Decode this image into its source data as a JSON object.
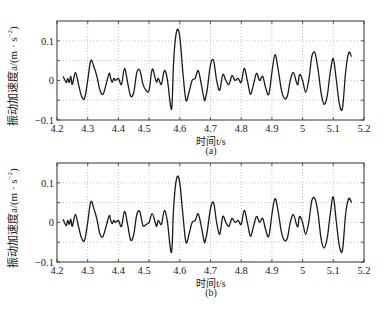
{
  "chart_data": [
    {
      "type": "line",
      "panel": "a",
      "caption": "(a)",
      "xlabel": "时间t/s",
      "ylabel": "振动加速度a/(m · s⁻²)",
      "xlim": [
        4.2,
        5.2
      ],
      "ylim": [
        -0.1,
        0.15
      ],
      "xticks": [
        "4.2",
        "4.3",
        "4.4",
        "4.5",
        "4.6",
        "4.7",
        "4.8",
        "4.9",
        "5",
        "5.1",
        "5.2"
      ],
      "yticks": [
        "-0.1",
        "0",
        "0.1"
      ],
      "grid": true,
      "series": [
        {
          "name": "acceleration",
          "x": [
            4.22,
            4.23,
            4.235,
            4.24,
            4.245,
            4.25,
            4.26,
            4.27,
            4.28,
            4.29,
            4.3,
            4.31,
            4.32,
            4.33,
            4.34,
            4.35,
            4.36,
            4.37,
            4.375,
            4.38,
            4.385,
            4.39,
            4.4,
            4.41,
            4.42,
            4.43,
            4.44,
            4.45,
            4.46,
            4.47,
            4.48,
            4.49,
            4.5,
            4.51,
            4.52,
            4.525,
            4.53,
            4.54,
            4.55,
            4.56,
            4.57,
            4.575,
            4.58,
            4.59,
            4.6,
            4.61,
            4.62,
            4.63,
            4.64,
            4.65,
            4.66,
            4.67,
            4.68,
            4.685,
            4.69,
            4.7,
            4.71,
            4.72,
            4.73,
            4.74,
            4.75,
            4.76,
            4.77,
            4.78,
            4.79,
            4.8,
            4.81,
            4.82,
            4.83,
            4.84,
            4.85,
            4.86,
            4.87,
            4.88,
            4.89,
            4.9,
            4.91,
            4.92,
            4.93,
            4.94,
            4.95,
            4.96,
            4.97,
            4.98,
            4.985,
            4.99,
            5.0,
            5.01,
            5.02,
            5.03,
            5.04,
            5.05,
            5.06,
            5.07,
            5.08,
            5.09,
            5.1,
            5.11,
            5.12,
            5.13,
            5.14,
            5.15,
            5.16,
            5.17,
            5.18,
            5.19
          ],
          "values": [
            0.01,
            -0.005,
            0.005,
            -0.005,
            0.01,
            -0.01,
            0.02,
            -0.01,
            -0.04,
            -0.045,
            0.0,
            0.05,
            0.035,
            0.01,
            -0.025,
            -0.035,
            -0.01,
            0.018,
            0.005,
            -0.005,
            0.005,
            0.0,
            0.005,
            -0.01,
            0.03,
            -0.005,
            -0.04,
            -0.03,
            0.02,
            0.025,
            -0.01,
            -0.025,
            -0.025,
            0.028,
            0.005,
            -0.005,
            0.005,
            -0.01,
            0.025,
            0.0,
            -0.065,
            -0.06,
            0.05,
            0.125,
            0.11,
            0.02,
            -0.05,
            -0.03,
            0.0,
            0.005,
            0.025,
            -0.01,
            -0.05,
            -0.04,
            -0.02,
            0.04,
            0.05,
            0.0,
            -0.025,
            0.015,
            0.0,
            -0.01,
            0.012,
            0.0,
            0.005,
            -0.005,
            0.03,
            0.0,
            -0.035,
            -0.01,
            0.018,
            0.0,
            0.01,
            -0.02,
            -0.035,
            0.02,
            0.065,
            0.03,
            -0.02,
            -0.045,
            -0.04,
            0.0,
            0.02,
            -0.005,
            -0.01,
            0.015,
            0.0,
            -0.03,
            0.0,
            0.06,
            0.07,
            0.03,
            -0.03,
            -0.06,
            -0.04,
            0.02,
            0.055,
            0.0,
            -0.06,
            -0.07,
            0.02,
            0.07,
            0.06,
            0.055
          ]
        }
      ]
    },
    {
      "type": "line",
      "panel": "b",
      "caption": "(b)",
      "xlabel": "时间t/s",
      "ylabel": "振动加速度a/(m · s⁻²)",
      "xlim": [
        4.2,
        5.2
      ],
      "ylim": [
        -0.1,
        0.15
      ],
      "xticks": [
        "4.2",
        "4.3",
        "4.4",
        "4.5",
        "4.6",
        "4.7",
        "4.8",
        "4.9",
        "5",
        "5.1",
        "5.2"
      ],
      "yticks": [
        "-0.1",
        "0",
        "0.1"
      ],
      "grid": true,
      "series": [
        {
          "name": "acceleration",
          "x": [
            4.22,
            4.23,
            4.235,
            4.24,
            4.245,
            4.25,
            4.26,
            4.27,
            4.28,
            4.29,
            4.3,
            4.31,
            4.32,
            4.33,
            4.34,
            4.35,
            4.36,
            4.37,
            4.375,
            4.38,
            4.385,
            4.39,
            4.4,
            4.41,
            4.42,
            4.43,
            4.44,
            4.45,
            4.46,
            4.47,
            4.48,
            4.49,
            4.5,
            4.51,
            4.52,
            4.525,
            4.53,
            4.54,
            4.55,
            4.56,
            4.57,
            4.575,
            4.58,
            4.59,
            4.6,
            4.61,
            4.62,
            4.63,
            4.64,
            4.65,
            4.66,
            4.67,
            4.68,
            4.685,
            4.69,
            4.7,
            4.71,
            4.72,
            4.73,
            4.74,
            4.75,
            4.76,
            4.77,
            4.78,
            4.79,
            4.8,
            4.81,
            4.82,
            4.83,
            4.84,
            4.85,
            4.86,
            4.87,
            4.88,
            4.89,
            4.9,
            4.91,
            4.92,
            4.93,
            4.94,
            4.95,
            4.96,
            4.97,
            4.98,
            4.985,
            4.99,
            5.0,
            5.01,
            5.02,
            5.03,
            5.04,
            5.05,
            5.06,
            5.07,
            5.08,
            5.09,
            5.1,
            5.11,
            5.12,
            5.13,
            5.14,
            5.15,
            5.16,
            5.17,
            5.18,
            5.19
          ],
          "values": [
            0.008,
            -0.008,
            0.005,
            -0.005,
            0.008,
            -0.01,
            0.02,
            -0.01,
            -0.04,
            -0.045,
            0.0,
            0.052,
            0.035,
            0.008,
            -0.03,
            -0.035,
            -0.01,
            0.017,
            0.005,
            -0.003,
            0.005,
            0.0,
            0.005,
            -0.01,
            0.028,
            -0.005,
            -0.045,
            -0.03,
            0.02,
            0.027,
            -0.008,
            -0.005,
            0.0,
            0.022,
            0.0,
            -0.01,
            0.005,
            -0.005,
            0.03,
            0.0,
            -0.07,
            -0.06,
            0.04,
            0.112,
            0.1,
            0.02,
            -0.05,
            -0.03,
            0.0,
            0.005,
            0.022,
            -0.01,
            -0.05,
            -0.04,
            -0.02,
            0.035,
            0.05,
            0.0,
            -0.03,
            0.015,
            0.0,
            -0.01,
            0.01,
            0.0,
            0.005,
            -0.005,
            0.03,
            0.0,
            -0.035,
            -0.01,
            0.015,
            0.0,
            0.01,
            -0.02,
            -0.035,
            0.02,
            0.06,
            0.03,
            -0.02,
            -0.045,
            -0.04,
            0.0,
            0.02,
            -0.005,
            -0.01,
            0.015,
            0.0,
            -0.03,
            0.0,
            0.055,
            0.06,
            0.025,
            -0.04,
            -0.065,
            -0.04,
            0.02,
            0.065,
            0.0,
            -0.06,
            -0.07,
            0.02,
            0.06,
            0.05,
            0.045
          ]
        }
      ]
    }
  ],
  "panels": {
    "a": {
      "caption": "(a)",
      "xlabel": "时间t/s",
      "ylabel_main": "振动加速度a/(m · s",
      "ylabel_exp": "−2",
      "ylabel_close": ")"
    },
    "b": {
      "caption": "(b)",
      "xlabel": "时间t/s",
      "ylabel_main": "振动加速度a/(m · s",
      "ylabel_exp": "−2",
      "ylabel_close": ")"
    }
  },
  "colors": {
    "line": "#1a1a1a",
    "axis": "#333333",
    "grid": "#9a9a9a",
    "background": "#ffffff"
  }
}
